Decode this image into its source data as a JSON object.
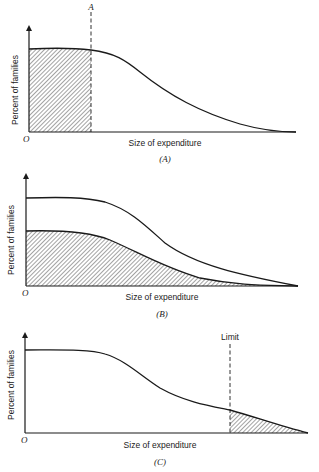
{
  "figure": {
    "panels": [
      {
        "id": "A",
        "caption": "(A)",
        "y_label": "Percent of families",
        "x_label": "Size of expenditure",
        "origin_label": "O",
        "marker_label": "A",
        "description": "Declining distribution curve; area left of dashed line A is hatched"
      },
      {
        "id": "B",
        "caption": "(B)",
        "y_label": "Percent of families",
        "x_label": "Size of expenditure",
        "origin_label": "O",
        "description": "Two declining curves; area under lower curve is hatched"
      },
      {
        "id": "C",
        "caption": "(C)",
        "y_label": "Percent of families",
        "x_label": "Size of expenditure",
        "origin_label": "O",
        "marker_label": "Limit",
        "description": "Declining curve; tail area right of dashed Limit line is hatched"
      }
    ],
    "colors": {
      "line": "#1a1a1a",
      "hatch": "#333333",
      "background": "#ffffff"
    }
  }
}
